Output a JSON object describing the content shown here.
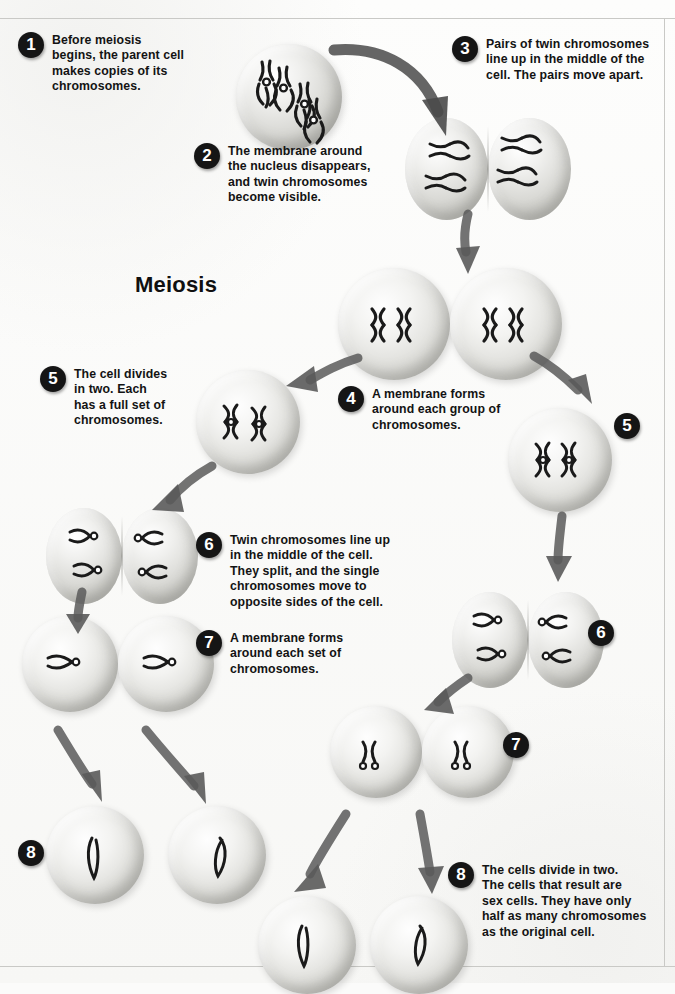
{
  "title": "Meiosis",
  "steps": [
    {
      "n": "1",
      "text": "Before meiosis\nbegins, the parent cell\nmakes copies of its\nchromosomes."
    },
    {
      "n": "2",
      "text": "The membrane around\nthe nucleus disappears,\nand twin chromosomes\nbecome visible."
    },
    {
      "n": "3",
      "text": "Pairs of twin chromosomes\nline up in the middle of the\ncell. The pairs move apart."
    },
    {
      "n": "4",
      "text": "A membrane forms\naround each group of\nchromosomes."
    },
    {
      "n": "5",
      "text": "The cell divides\nin two. Each\nhas a full set of\nchromosomes."
    },
    {
      "n": "6",
      "text": "Twin chromosomes line up\nin the middle of the cell.\nThey split, and the single\nchromosomes move to\nopposite sides of the cell."
    },
    {
      "n": "7",
      "text": "A membrane forms\naround each set of\nchromosomes."
    },
    {
      "n": "8",
      "text": "The cells divide in two.\nThe cells that result are\nsex cells. They have only\nhalf as many chromosomes\nas the original cell."
    }
  ],
  "markers": [
    {
      "n": "5"
    },
    {
      "n": "6"
    },
    {
      "n": "7"
    },
    {
      "n": "8"
    }
  ],
  "colors": {
    "badge_fill": "#151515",
    "badge_text": "#ffffff",
    "text": "#131313",
    "chromosome": "#1a1a1a",
    "page_bg": "#fbfbfa"
  },
  "cell_labels": {
    "parent_cell": "parent cell with twin chromosomes",
    "dividing_cell": "cell dividing in two",
    "daughter_cell": "daughter cell",
    "sex_cell": "sex cell with single chromosome"
  }
}
